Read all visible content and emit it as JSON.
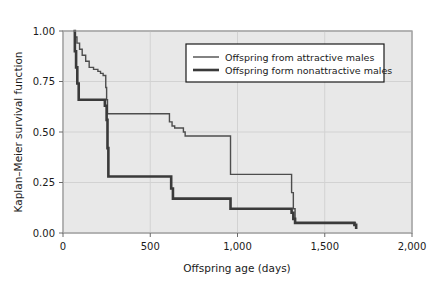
{
  "chart_data": {
    "type": "line",
    "subtype": "kaplan-meier-step",
    "title": "",
    "xlabel": "Offspring age (days)",
    "ylabel": "Kaplan–Meier survival function",
    "xlim": [
      0,
      2000
    ],
    "ylim": [
      0.0,
      1.0
    ],
    "xticks": [
      0,
      500,
      1000,
      1500,
      2000
    ],
    "xtick_labels": [
      "0",
      "500",
      "1,000",
      "1,500",
      "2,000"
    ],
    "yticks": [
      0.0,
      0.25,
      0.5,
      0.75,
      1.0
    ],
    "ytick_labels": [
      "0.00",
      "0.25",
      "0.50",
      "0.75",
      "1.00"
    ],
    "grid": true,
    "grid_color": "#d2d2d2",
    "plot_background": "#e8e8e8",
    "legend_position": "upper center",
    "legend": [
      "Offspring from attractive males",
      "Offspring form nonattractive males"
    ],
    "series": [
      {
        "name": "Offspring from attractive males",
        "color": "#4d4d4d",
        "line_width": 1.4,
        "x": [
          60,
          70,
          80,
          95,
          110,
          130,
          150,
          175,
          200,
          215,
          230,
          245,
          250,
          255,
          600,
          610,
          625,
          640,
          690,
          700,
          950,
          960,
          1300,
          1310,
          1320,
          1330,
          1680
        ],
        "y": [
          1.0,
          0.97,
          0.94,
          0.91,
          0.88,
          0.85,
          0.82,
          0.81,
          0.8,
          0.79,
          0.78,
          0.72,
          0.66,
          0.59,
          0.59,
          0.55,
          0.53,
          0.52,
          0.5,
          0.48,
          0.48,
          0.29,
          0.29,
          0.2,
          0.12,
          0.05,
          0.05
        ]
      },
      {
        "name": "Offspring form nonattractive males",
        "color": "#3a3a3a",
        "line_width": 2.6,
        "x": [
          60,
          68,
          75,
          82,
          90,
          230,
          240,
          250,
          255,
          260,
          610,
          620,
          630,
          950,
          960,
          1300,
          1310,
          1320,
          1330,
          1660,
          1670,
          1680
        ],
        "y": [
          1.0,
          0.9,
          0.82,
          0.74,
          0.66,
          0.66,
          0.63,
          0.56,
          0.42,
          0.28,
          0.28,
          0.22,
          0.17,
          0.17,
          0.12,
          0.12,
          0.1,
          0.07,
          0.05,
          0.05,
          0.04,
          0.02
        ]
      }
    ]
  },
  "axes": {
    "ylabel": "Kaplan–Meier survival function",
    "xlabel": "Offspring age (days)"
  }
}
